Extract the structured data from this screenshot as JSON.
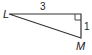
{
  "diagram": {
    "type": "right-triangle",
    "vertices": {
      "L": {
        "label": "L"
      },
      "M": {
        "label": "M"
      },
      "right_angle_vertex": {
        "label": ""
      }
    },
    "sides": {
      "top": {
        "label": "3"
      },
      "right": {
        "label": "1"
      }
    },
    "colors": {
      "stroke": "#333333",
      "text": "#222222"
    }
  }
}
